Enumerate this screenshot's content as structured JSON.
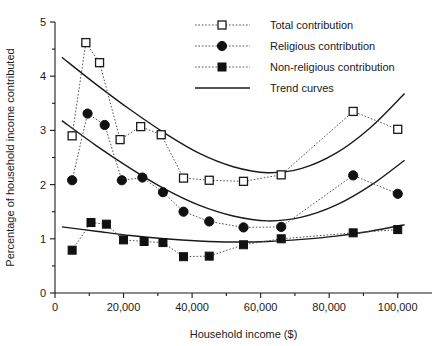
{
  "chart_data": {
    "type": "scatter",
    "title": "",
    "xlabel": "Household income ($)",
    "ylabel": "Percentage of household income contributed",
    "xlim": [
      0,
      110000
    ],
    "ylim": [
      0,
      5
    ],
    "xticks": [
      0,
      20000,
      40000,
      60000,
      80000,
      100000
    ],
    "xticklabels": [
      "0",
      "20,000",
      "40,000",
      "60,000",
      "80,000",
      "100,000"
    ],
    "yticks": [
      0,
      1,
      2,
      3,
      4,
      5
    ],
    "yticklabels": [
      "0",
      "1",
      "2",
      "3",
      "4",
      "5"
    ],
    "yminorticks": [
      0.5,
      1.5,
      2.5,
      3.5,
      4.5
    ],
    "grid": false,
    "legend_position": "top-center",
    "series": [
      {
        "name": "Total contribution",
        "marker": "open-square",
        "linestyle": "dotted",
        "points": [
          {
            "x": 5000,
            "y": 2.9
          },
          {
            "x": 9000,
            "y": 4.62
          },
          {
            "x": 13000,
            "y": 4.25
          },
          {
            "x": 19000,
            "y": 2.83
          },
          {
            "x": 25000,
            "y": 3.07
          },
          {
            "x": 31000,
            "y": 2.92
          },
          {
            "x": 37500,
            "y": 2.12
          },
          {
            "x": 45000,
            "y": 2.08
          },
          {
            "x": 55000,
            "y": 2.06
          },
          {
            "x": 66000,
            "y": 2.18
          },
          {
            "x": 87000,
            "y": 3.35
          },
          {
            "x": 100000,
            "y": 3.02
          }
        ]
      },
      {
        "name": "Religious contribution",
        "marker": "filled-circle",
        "linestyle": "dotted",
        "points": [
          {
            "x": 5000,
            "y": 2.08
          },
          {
            "x": 9500,
            "y": 3.31
          },
          {
            "x": 14500,
            "y": 3.1
          },
          {
            "x": 19500,
            "y": 2.08
          },
          {
            "x": 25500,
            "y": 2.13
          },
          {
            "x": 31500,
            "y": 1.86
          },
          {
            "x": 37500,
            "y": 1.5
          },
          {
            "x": 45000,
            "y": 1.32
          },
          {
            "x": 55000,
            "y": 1.21
          },
          {
            "x": 66000,
            "y": 1.22
          },
          {
            "x": 87000,
            "y": 2.17
          },
          {
            "x": 100000,
            "y": 1.83
          }
        ]
      },
      {
        "name": "Non-religious contribution",
        "marker": "filled-square",
        "linestyle": "dotted",
        "points": [
          {
            "x": 5000,
            "y": 0.79
          },
          {
            "x": 10500,
            "y": 1.3
          },
          {
            "x": 15000,
            "y": 1.27
          },
          {
            "x": 20000,
            "y": 0.98
          },
          {
            "x": 26000,
            "y": 0.95
          },
          {
            "x": 31500,
            "y": 0.93
          },
          {
            "x": 37500,
            "y": 0.67
          },
          {
            "x": 45000,
            "y": 0.68
          },
          {
            "x": 55000,
            "y": 0.89
          },
          {
            "x": 66000,
            "y": 1.0
          },
          {
            "x": 87000,
            "y": 1.11
          },
          {
            "x": 100000,
            "y": 1.17
          }
        ]
      },
      {
        "name": "Trend curves",
        "marker": "none",
        "linestyle": "solid",
        "curves": [
          {
            "label": "total-trend",
            "points": [
              {
                "x": 2000,
                "y": 4.35
              },
              {
                "x": 12000,
                "y": 3.85
              },
              {
                "x": 22000,
                "y": 3.38
              },
              {
                "x": 32000,
                "y": 2.95
              },
              {
                "x": 42000,
                "y": 2.58
              },
              {
                "x": 52000,
                "y": 2.33
              },
              {
                "x": 62000,
                "y": 2.22
              },
              {
                "x": 72000,
                "y": 2.3
              },
              {
                "x": 82000,
                "y": 2.58
              },
              {
                "x": 92000,
                "y": 3.05
              },
              {
                "x": 102000,
                "y": 3.68
              }
            ]
          },
          {
            "label": "religious-trend",
            "points": [
              {
                "x": 2000,
                "y": 3.18
              },
              {
                "x": 12000,
                "y": 2.72
              },
              {
                "x": 22000,
                "y": 2.3
              },
              {
                "x": 32000,
                "y": 1.92
              },
              {
                "x": 42000,
                "y": 1.62
              },
              {
                "x": 52000,
                "y": 1.42
              },
              {
                "x": 62000,
                "y": 1.33
              },
              {
                "x": 72000,
                "y": 1.4
              },
              {
                "x": 82000,
                "y": 1.62
              },
              {
                "x": 92000,
                "y": 1.98
              },
              {
                "x": 102000,
                "y": 2.45
              }
            ]
          },
          {
            "label": "nonreligious-trend",
            "points": [
              {
                "x": 2000,
                "y": 1.22
              },
              {
                "x": 12000,
                "y": 1.14
              },
              {
                "x": 22000,
                "y": 1.06
              },
              {
                "x": 32000,
                "y": 1.0
              },
              {
                "x": 42000,
                "y": 0.96
              },
              {
                "x": 52000,
                "y": 0.94
              },
              {
                "x": 62000,
                "y": 0.95
              },
              {
                "x": 72000,
                "y": 0.99
              },
              {
                "x": 82000,
                "y": 1.05
              },
              {
                "x": 92000,
                "y": 1.14
              },
              {
                "x": 102000,
                "y": 1.26
              }
            ]
          }
        ]
      }
    ],
    "legend": [
      {
        "label": "Total contribution",
        "marker": "open-square",
        "linestyle": "dotted"
      },
      {
        "label": "Religious contribution",
        "marker": "filled-circle",
        "linestyle": "dotted"
      },
      {
        "label": "Non-religious contribution",
        "marker": "filled-square",
        "linestyle": "dotted"
      },
      {
        "label": "Trend curves",
        "marker": "none",
        "linestyle": "solid"
      }
    ]
  }
}
